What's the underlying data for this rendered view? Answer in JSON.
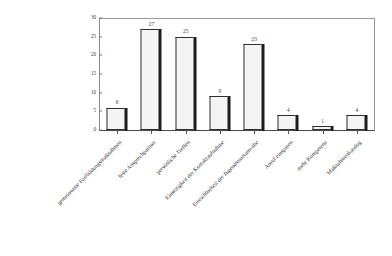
{
  "chart_data": {
    "type": "bar",
    "title": "",
    "subtitle": "",
    "xlabel": "",
    "ylabel": "",
    "ylim": [
      0,
      30
    ],
    "ytick_step": 5,
    "yticks": [
      0,
      5,
      10,
      15,
      20,
      25,
      30
    ],
    "grid": false,
    "legend": false,
    "legend_position": "none",
    "bar_style": "3d-shadow",
    "bar_fill_color": "#f4f4f4",
    "bar_edge_color": "#2e2e2e",
    "bar_shadow_color": "#1d1d1d",
    "categories": [
      "gemeinsame Fortbildungsmaßnahmen",
      "feste Ansprechpartner",
      "persönliche Treffen",
      "Einseitigkeit der Kontaktaufnahme",
      "Erreichbarkeit der Jugendstaatsanwälte",
      "Anruf einsparen",
      "mehr Kompetenz",
      "Maßnahmenkatalog"
    ],
    "values": [
      6,
      27,
      25,
      9,
      23,
      4,
      1,
      4
    ],
    "data_labels": [
      "6",
      "27",
      "25",
      "9",
      "23",
      "4",
      "1",
      "4"
    ],
    "ytick_labels": [
      "0",
      "5",
      "10",
      "15",
      "20",
      "25",
      "30"
    ]
  }
}
